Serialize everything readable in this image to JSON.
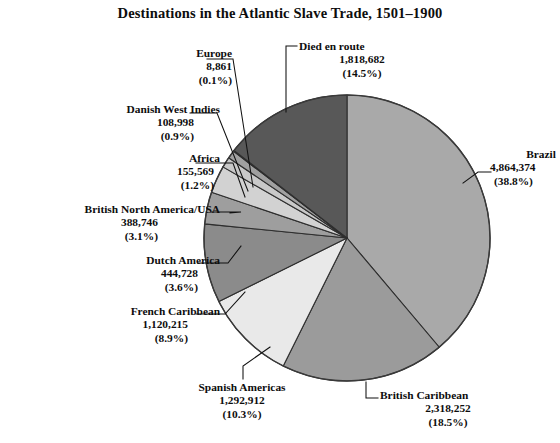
{
  "chart_data": {
    "type": "pie",
    "title": "Destinations in the Atlantic Slave Trade, 1501–1900",
    "xlabel": "",
    "ylabel": "",
    "legend_position": "none",
    "grid": false,
    "total": 12522437,
    "start_angle_deg": 0,
    "direction": "clockwise",
    "categories": [
      "Brazil",
      "British Caribbean",
      "Spanish Americas",
      "French Caribbean",
      "Dutch America",
      "British North America/USA",
      "Africa",
      "Danish West Indies",
      "Europe",
      "Died en route"
    ],
    "values": [
      4864374,
      2318252,
      1292912,
      1120215,
      444728,
      388746,
      155569,
      108998,
      8861,
      1818682
    ],
    "percents": [
      38.8,
      18.5,
      10.3,
      8.9,
      3.6,
      3.1,
      1.2,
      0.9,
      0.1,
      14.5
    ],
    "colors": [
      "#a9a9a9",
      "#9b9b9b",
      "#e9e9e9",
      "#8b8b8b",
      "#9e9e9e",
      "#d2d2d2",
      "#c9c9c9",
      "#a0a0a0",
      "#2a2a2a",
      "#585858"
    ],
    "slices": [
      {
        "name": "Brazil",
        "value_label": "4,864,374",
        "percent_label": "(38.8%)",
        "percent": 38.8,
        "color": "#a9a9a9"
      },
      {
        "name": "British Caribbean",
        "value_label": "2,318,252",
        "percent_label": "(18.5%)",
        "percent": 18.5,
        "color": "#9b9b9b"
      },
      {
        "name": "Spanish Americas",
        "value_label": "1,292,912",
        "percent_label": "(10.3%)",
        "percent": 10.3,
        "color": "#e9e9e9"
      },
      {
        "name": "French Caribbean",
        "value_label": "1,120,215",
        "percent_label": "(8.9%)",
        "percent": 8.9,
        "color": "#8b8b8b"
      },
      {
        "name": "Dutch America",
        "value_label": "444,728",
        "percent_label": "(3.6%)",
        "percent": 3.6,
        "color": "#9e9e9e"
      },
      {
        "name": "British North America/USA",
        "value_label": "388,746",
        "percent_label": "(3.1%)",
        "percent": 3.1,
        "color": "#d2d2d2"
      },
      {
        "name": "Africa",
        "value_label": "155,569",
        "percent_label": "(1.2%)",
        "percent": 1.2,
        "color": "#c9c9c9"
      },
      {
        "name": "Danish West Indies",
        "value_label": "108,998",
        "percent_label": "(0.9%)",
        "percent": 0.9,
        "color": "#a0a0a0"
      },
      {
        "name": "Europe",
        "value_label": "8,861",
        "percent_label": "(0.1%)",
        "percent": 0.1,
        "color": "#2a2a2a"
      },
      {
        "name": "Died en route",
        "value_label": "1,818,682",
        "percent_label": "(14.5%)",
        "percent": 14.5,
        "color": "#585858"
      }
    ]
  },
  "title": "Destinations in the Atlantic Slave Trade, 1501–1900",
  "labels": {
    "brazil": {
      "name": "Brazil",
      "value": "4,864,374",
      "percent": "(38.8%)"
    },
    "british_caribbean": {
      "name": "British Caribbean",
      "value": "2,318,252",
      "percent": "(18.5%)"
    },
    "spanish_americas": {
      "name": "Spanish Americas",
      "value": "1,292,912",
      "percent": "(10.3%)"
    },
    "french_caribbean": {
      "name": "French Caribbean",
      "value": "1,120,215",
      "percent": "(8.9%)"
    },
    "dutch_america": {
      "name": "Dutch America",
      "value": "444,728",
      "percent": "(3.6%)"
    },
    "bna_usa": {
      "name": "British North America/USA",
      "value": "388,746",
      "percent": "(3.1%)"
    },
    "africa": {
      "name": "Africa",
      "value": "155,569",
      "percent": "(1.2%)"
    },
    "danish_west_indies": {
      "name": "Danish West Indies",
      "value": "108,998",
      "percent": "(0.9%)"
    },
    "europe": {
      "name": "Europe",
      "value": "8,861",
      "percent": "(0.1%)"
    },
    "died_en_route": {
      "name": "Died en route",
      "value": "1,818,682",
      "percent": "(14.5%)"
    }
  }
}
